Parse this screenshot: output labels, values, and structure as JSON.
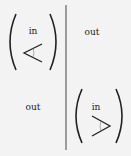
{
  "diagram": {
    "quadrants": {
      "top_left": {
        "label": "in",
        "symbol": "less-than angle",
        "enclosed": true
      },
      "top_right": {
        "label": "out"
      },
      "bottom_left": {
        "label": "out"
      },
      "bottom_right": {
        "label": "in",
        "symbol": "greater-than angle",
        "enclosed": true
      }
    },
    "colors": {
      "ink": "#222222",
      "background": "#f3f3f3"
    }
  }
}
